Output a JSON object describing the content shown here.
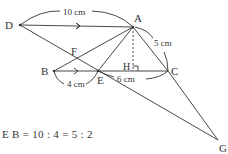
{
  "diagram": {
    "points": {
      "A": {
        "label": "A",
        "x": 133,
        "y": 27
      },
      "B": {
        "label": "B",
        "x": 54,
        "y": 71
      },
      "C": {
        "label": "C",
        "x": 168,
        "y": 71
      },
      "D": {
        "label": "D",
        "x": 20,
        "y": 25
      },
      "E": {
        "label": "E",
        "x": 98,
        "y": 71
      },
      "F": {
        "label": "F",
        "x": 76,
        "y": 59
      },
      "G": {
        "label": "G",
        "x": 218,
        "y": 140
      },
      "H": {
        "label": "H",
        "x": 133,
        "y": 71
      }
    },
    "measurements": {
      "DA": "10 cm",
      "AC": "5 cm",
      "BE": "4 cm",
      "EC": "6 cm"
    },
    "equation": "E B = 10 : 4 = 5 : 2",
    "colors": {
      "line": "#333333",
      "background": "#ffffff"
    }
  }
}
